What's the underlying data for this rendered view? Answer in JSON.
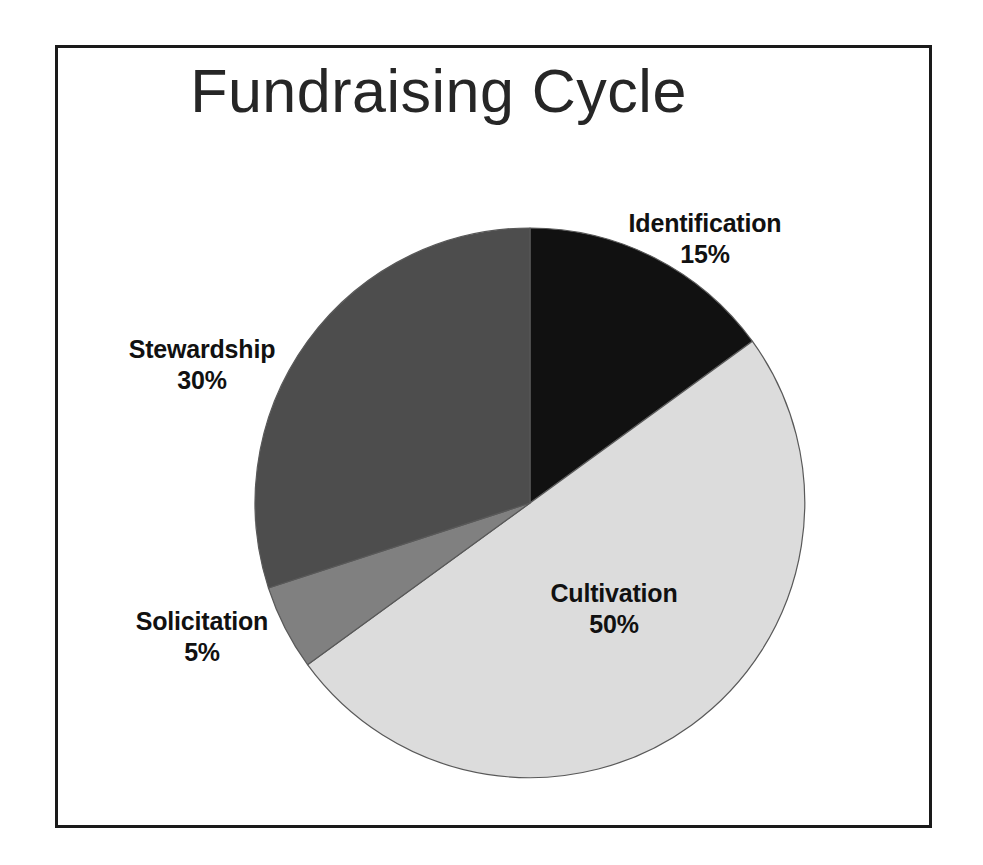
{
  "page": {
    "background_color": "#ffffff",
    "frame_border_color": "#1a1a1a"
  },
  "chart_data": {
    "type": "pie",
    "title": "Fundraising Cycle",
    "xlabel": "",
    "ylabel": "",
    "legend_position": "none",
    "grid": false,
    "start_angle_deg": 0,
    "direction": "clockwise",
    "categories": [
      "Identification",
      "Cultivation",
      "Solicitation",
      "Stewardship"
    ],
    "values": [
      15,
      50,
      5,
      30
    ],
    "value_unit": "%",
    "value_labels": [
      "15%",
      "50%",
      "5%",
      "30%"
    ],
    "colors": [
      "#111111",
      "#dcdcdc",
      "#808080",
      "#4d4d4d"
    ],
    "slices": [
      {
        "name": "Identification",
        "value": 15,
        "value_label": "15%",
        "color": "#111111",
        "start_deg": 0,
        "end_deg": 54,
        "label_color": "#111111"
      },
      {
        "name": "Cultivation",
        "value": 50,
        "value_label": "50%",
        "color": "#dcdcdc",
        "start_deg": 54,
        "end_deg": 234,
        "label_color": "#111111"
      },
      {
        "name": "Solicitation",
        "value": 5,
        "value_label": "5%",
        "color": "#808080",
        "start_deg": 234,
        "end_deg": 252,
        "label_color": "#111111"
      },
      {
        "name": "Stewardship",
        "value": 30,
        "value_label": "30%",
        "color": "#4d4d4d",
        "start_deg": 252,
        "end_deg": 360,
        "label_color": "#111111"
      }
    ]
  }
}
